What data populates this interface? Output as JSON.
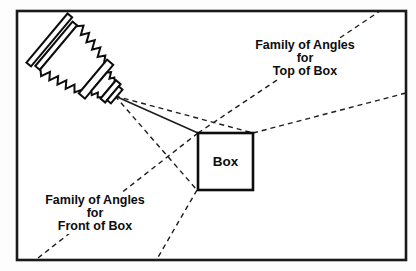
{
  "figure": {
    "type": "line-art-diagram",
    "colors": {
      "ink": "#111111",
      "background": "#ffffff",
      "frame_border": "#1a1a1a"
    },
    "icons": {
      "camera": "bellows-view-camera-icon"
    },
    "labels": {
      "top": {
        "line1": "Family of Angles",
        "line2": "for",
        "line3": "Top of Box"
      },
      "bottom": {
        "line1": "Family of Angles",
        "line2": "for",
        "line3": "Front of Box"
      },
      "box": "Box"
    }
  }
}
